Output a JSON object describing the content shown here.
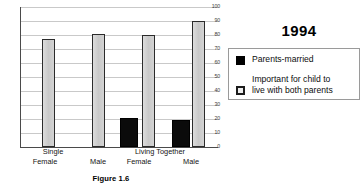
{
  "figure": {
    "caption": "Figure 1.6",
    "legend_title": "1994"
  },
  "legend": {
    "entries": [
      {
        "label": "Parents-married",
        "swatch": "black-filled-square",
        "color": "#000000"
      },
      {
        "label_line1": "Important for child to",
        "label_line2": "live with both parents",
        "swatch": "white-outlined-square",
        "color": "#ededed"
      }
    ]
  },
  "axis": {
    "y_ticks": [
      "100",
      "90",
      "80",
      "70",
      "60",
      "50",
      "40",
      "30",
      "20",
      "10",
      "0"
    ],
    "group_labels": [
      "Single",
      "Living Together"
    ],
    "sub_labels": [
      "Female",
      "Male",
      "Female",
      "Male"
    ]
  },
  "chart_data": {
    "type": "bar",
    "title": "Figure 1.6",
    "subtitle": "1994",
    "xlabel": "",
    "ylabel": "",
    "ylim": [
      0,
      100
    ],
    "y_tick_step": 10,
    "grid": true,
    "legend_position": "right",
    "categories": [
      "Single Female",
      "Single Male",
      "Living Together Female",
      "Living Together Male"
    ],
    "groups": [
      {
        "name": "Single",
        "members": [
          "Female",
          "Male"
        ]
      },
      {
        "name": "Living Together",
        "members": [
          "Female",
          "Male"
        ]
      }
    ],
    "series": [
      {
        "name": "Parents-married",
        "color": "#000000",
        "values": [
          null,
          null,
          21,
          19
        ]
      },
      {
        "name": "Important for child to live with both parents",
        "color": "#d0d0d0",
        "values": [
          77,
          81,
          80,
          90
        ]
      }
    ]
  }
}
